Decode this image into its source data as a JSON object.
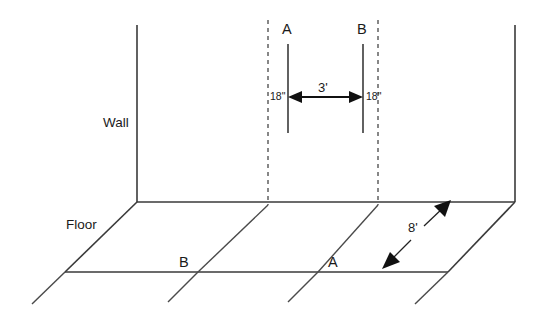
{
  "diagram": {
    "surfaces": {
      "wall_label": "Wall",
      "floor_label": "Floor"
    },
    "wall_markers": [
      {
        "id": "A",
        "label": "A",
        "x": 288,
        "top_y": 44,
        "bottom_y": 133,
        "offset_label": "18\""
      },
      {
        "id": "B",
        "label": "B",
        "x": 363,
        "top_y": 44,
        "bottom_y": 133,
        "offset_label": "18\""
      }
    ],
    "floor_markers": [
      {
        "id": "B",
        "label": "B",
        "x": 183,
        "y": 265
      },
      {
        "id": "A",
        "label": "A",
        "x": 332,
        "y": 265
      }
    ],
    "dimensions": [
      {
        "id": "horizontal-span",
        "label": "3'",
        "from": "A",
        "to": "B",
        "orientation": "horizontal"
      },
      {
        "id": "left-offset",
        "label": "18\"",
        "orientation": "horizontal",
        "side": "left"
      },
      {
        "id": "right-offset",
        "label": "18\"",
        "orientation": "horizontal",
        "side": "right"
      },
      {
        "id": "floor-depth",
        "label": "8'",
        "orientation": "diagonal"
      }
    ],
    "colors": {
      "line": "#3a3a3a",
      "dashed": "#555555",
      "arrow": "#111111",
      "text": "#1a1a1a",
      "background": "#ffffff"
    }
  }
}
